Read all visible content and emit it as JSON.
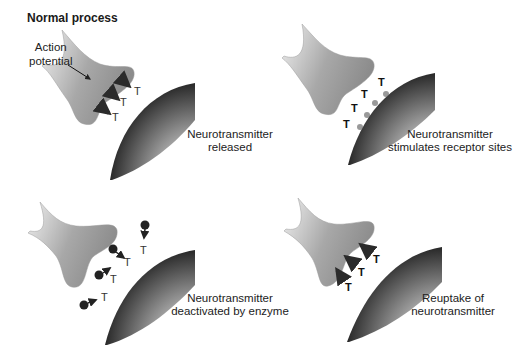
{
  "title": "Normal process",
  "panels": [
    {
      "id": "released",
      "caption_line1": "Neurotransmitter",
      "caption_line2": "released",
      "annotation": {
        "line1": "Action",
        "line2": "potential"
      },
      "molecule_symbol": "T",
      "molecule_count": 3
    },
    {
      "id": "stimulates",
      "caption_line1": "Neurotransmitter",
      "caption_line2": "stimulates receptor sites",
      "molecule_symbol": "T",
      "molecule_count": 4
    },
    {
      "id": "deactivated",
      "caption_line1": "Neurotransmitter",
      "caption_line2": "deactivated by enzyme",
      "molecule_symbol": "T",
      "molecule_count": 4,
      "enzyme_count": 4
    },
    {
      "id": "reuptake",
      "caption_line1": "Reuptake of",
      "caption_line2": "neurotransmitter",
      "molecule_symbol": "T",
      "molecule_count": 3
    }
  ],
  "colors": {
    "terminal_light": "#e6e6e6",
    "terminal_dark": "#8a8a8a",
    "receptor_dark": "#2a2a2a",
    "receptor_light": "#f5f5f5",
    "arrow": "#2b2b2b"
  }
}
